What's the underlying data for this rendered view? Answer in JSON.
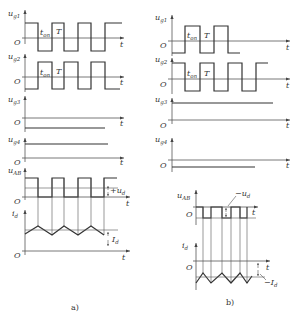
{
  "panel_a": {
    "caption": "a)",
    "signals": {
      "ug1": {
        "name": "u",
        "sub": "g1"
      },
      "ug2": {
        "name": "u",
        "sub": "g2"
      },
      "ug3": {
        "name": "u",
        "sub": "g3"
      },
      "ug4": {
        "name": "u",
        "sub": "g4"
      },
      "uAB": {
        "name": "u",
        "sub": "AB"
      },
      "id": {
        "name": "i",
        "sub": "d"
      }
    },
    "annotations": {
      "ton": {
        "name": "t",
        "sub": "on"
      },
      "T": "T",
      "ud": {
        "name": "+u",
        "sub": "d"
      },
      "Id": {
        "name": "I",
        "sub": "d"
      }
    },
    "origin": "O",
    "time_axis": "t"
  },
  "panel_b": {
    "caption": "b)",
    "signals": {
      "ug1": {
        "name": "u",
        "sub": "g1"
      },
      "ug2": {
        "name": "u",
        "sub": "g2"
      },
      "ug3": {
        "name": "u",
        "sub": "g3"
      },
      "ug4": {
        "name": "u",
        "sub": "g4"
      },
      "uAB": {
        "name": "u",
        "sub": "AB"
      },
      "id": {
        "name": "i",
        "sub": "d"
      }
    },
    "annotations": {
      "ton": {
        "name": "t",
        "sub": "on"
      },
      "T": "T",
      "ud": {
        "name": "−u",
        "sub": "d"
      },
      "Id": {
        "name": "−I",
        "sub": "d"
      }
    },
    "origin": "O",
    "time_axis": "t"
  }
}
